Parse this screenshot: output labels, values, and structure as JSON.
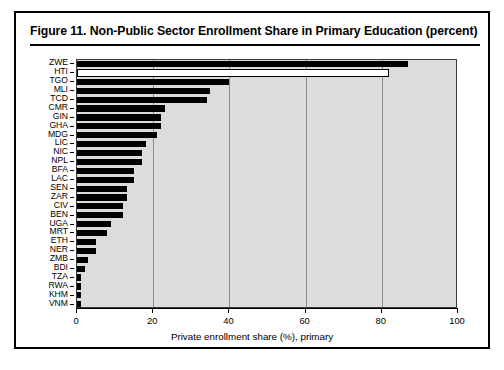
{
  "figure": {
    "title": "Figure 11.  Non-Public Sector Enrollment Share in Primary Education (percent)"
  },
  "chart_data": {
    "type": "bar",
    "orientation": "horizontal",
    "title": "Figure 11.  Non-Public Sector Enrollment Share in Primary Education (percent)",
    "xlabel": "Private enrollment share (%), primary",
    "ylabel": "",
    "xlim": [
      0,
      100
    ],
    "xticks": [
      0,
      20,
      40,
      60,
      80,
      100
    ],
    "xticklabels": [
      "0",
      "20",
      "40",
      "60",
      "80",
      "100"
    ],
    "grid": "vertical",
    "legend": "none",
    "plot_background": "#dcdcdc",
    "bar_color": "#000000",
    "highlight_bar_color": "#ffffff",
    "categories": [
      "ZWE",
      "HTI",
      "TGO",
      "MLI",
      "TCD",
      "CMR",
      "GIN",
      "GHA",
      "MDG",
      "LIC",
      "NIC",
      "NPL",
      "BFA",
      "LAC",
      "SEN",
      "ZAR",
      "CIV",
      "BEN",
      "UGA",
      "MRT",
      "ETH",
      "NER",
      "ZMB",
      "BDI",
      "TZA",
      "RWA",
      "KHM",
      "VNM"
    ],
    "values": [
      87,
      82,
      40,
      35,
      34,
      23,
      22,
      22,
      21,
      18,
      17,
      17,
      15,
      15,
      13,
      13,
      12,
      12,
      9,
      8,
      5,
      5,
      3,
      2,
      1,
      1,
      1,
      1
    ],
    "bar_styles": [
      "filled",
      "hollow",
      "filled",
      "filled",
      "filled",
      "filled",
      "filled",
      "filled",
      "filled",
      "filled",
      "filled",
      "filled",
      "filled",
      "filled",
      "filled",
      "filled",
      "filled",
      "filled",
      "filled",
      "filled",
      "filled",
      "filled",
      "filled",
      "filled",
      "filled",
      "filled",
      "filled",
      "filled"
    ]
  }
}
